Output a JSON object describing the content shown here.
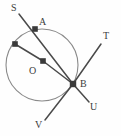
{
  "figure": {
    "type": "geometry-diagram",
    "width": 121,
    "height": 136,
    "background_color": "#fefefe",
    "stroke_color": "#4a4a4a",
    "circle_stroke_color": "#8a8a8a",
    "marker_color": "#3a3a3a",
    "label_color": "#3c3c3c"
  },
  "circle": {
    "center_x": 42,
    "center_y": 65,
    "radius": 36
  },
  "points": [
    {
      "name": "A",
      "x": 35,
      "y": 29,
      "marker": true,
      "label": "A",
      "label_x": 39,
      "label_y": 17
    },
    {
      "name": "P",
      "x": 15,
      "y": 44,
      "marker": true,
      "label": "",
      "label_x": 0,
      "label_y": 0
    },
    {
      "name": "O",
      "x": 43,
      "y": 61,
      "marker": true,
      "label": "O",
      "label_x": 29,
      "label_y": 66
    },
    {
      "name": "B",
      "x": 73,
      "y": 84,
      "marker": true,
      "label": "B",
      "label_x": 80,
      "label_y": 79
    },
    {
      "name": "S",
      "x": 19,
      "y": 14,
      "marker": false,
      "label": "S",
      "label_x": 11,
      "label_y": 3
    },
    {
      "name": "T",
      "x": 101,
      "y": 44,
      "marker": false,
      "label": "T",
      "label_x": 103,
      "label_y": 31
    },
    {
      "name": "U",
      "x": 89,
      "y": 102,
      "marker": false,
      "label": "U",
      "label_x": 90,
      "label_y": 102
    },
    {
      "name": "V",
      "x": 45,
      "y": 120,
      "marker": false,
      "label": "V",
      "label_x": 35,
      "label_y": 120
    }
  ],
  "segments": [
    {
      "name": "secant-S-B",
      "from": "S",
      "to": "B",
      "x1": 19,
      "y1": 14,
      "x2": 73,
      "y2": 84
    },
    {
      "name": "chord-P-O",
      "from": "P",
      "to": "O",
      "x1": 15,
      "y1": 44,
      "x2": 43,
      "y2": 61
    },
    {
      "name": "radius-O-B",
      "from": "O",
      "to": "B",
      "x1": 43,
      "y1": 61,
      "x2": 73,
      "y2": 84
    },
    {
      "name": "ray-B-T",
      "from": "B",
      "to": "T",
      "x1": 73,
      "y1": 84,
      "x2": 101,
      "y2": 44
    },
    {
      "name": "ray-B-V",
      "from": "B",
      "to": "V",
      "x1": 73,
      "y1": 84,
      "x2": 45,
      "y2": 120
    },
    {
      "name": "ray-B-U",
      "from": "B",
      "to": "U",
      "x1": 73,
      "y1": 84,
      "x2": 89,
      "y2": 102
    }
  ],
  "labels": {
    "S": "S",
    "A": "A",
    "O": "O",
    "B": "B",
    "T": "T",
    "U": "U",
    "V": "V"
  }
}
